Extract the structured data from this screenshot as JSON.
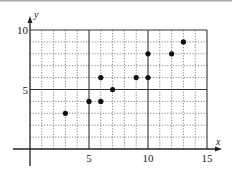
{
  "chart_data": {
    "type": "scatter",
    "title": "",
    "xlabel": "x",
    "ylabel": "y",
    "xlim": [
      0,
      15
    ],
    "ylim": [
      0,
      10
    ],
    "grid": true,
    "grid_minor_step": 1,
    "grid_major_step": 5,
    "legend": null,
    "x_ticks": [
      "5",
      "10",
      "15"
    ],
    "y_ticks": [
      "5",
      "10"
    ],
    "points": [
      {
        "x": 3,
        "y": 3
      },
      {
        "x": 5,
        "y": 4
      },
      {
        "x": 6,
        "y": 4
      },
      {
        "x": 6,
        "y": 6
      },
      {
        "x": 7,
        "y": 5
      },
      {
        "x": 9,
        "y": 6
      },
      {
        "x": 10,
        "y": 6
      },
      {
        "x": 10,
        "y": 8
      },
      {
        "x": 12,
        "y": 8
      },
      {
        "x": 13,
        "y": 9
      }
    ]
  },
  "colors": {
    "point": "#111111",
    "axis": "#222222",
    "major_grid": "#333333",
    "minor_grid": "#666666"
  }
}
